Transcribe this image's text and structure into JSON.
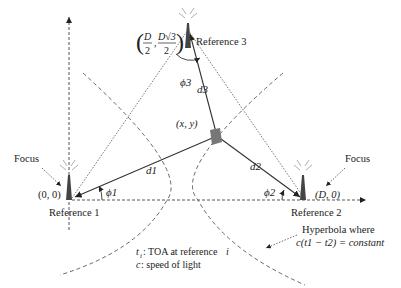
{
  "diagram": {
    "type": "tdoa-hyperbolic-positioning",
    "references": [
      {
        "label": "Reference 1",
        "coord": "(0, 0)",
        "angle": "ϕ1",
        "distance": "d1"
      },
      {
        "label": "Reference 2",
        "coord": "(D, 0)",
        "angle": "ϕ2",
        "distance": "d2"
      },
      {
        "label": "Reference 3",
        "coord_num1": "D",
        "coord_den1": "2",
        "coord_num2": "D√3",
        "coord_den2": "2",
        "angle": "ϕ3",
        "distance": "d3"
      }
    ],
    "target": {
      "label": "(x, y)"
    },
    "focus_labels": [
      "Focus",
      "Focus"
    ],
    "hyperbola_note": {
      "line1": "Hyperbola where",
      "line2": "c(t1 − t2) = constant"
    },
    "legend": {
      "line1_sym": "t",
      "line1_sub": "i",
      "line1_text": ": TOA at reference ",
      "line1_i": "i",
      "line2_sym": "c",
      "line2_text": ": speed of light"
    },
    "colors": {
      "line": "#333333",
      "dashed": "#555555",
      "text": "#222222"
    }
  }
}
